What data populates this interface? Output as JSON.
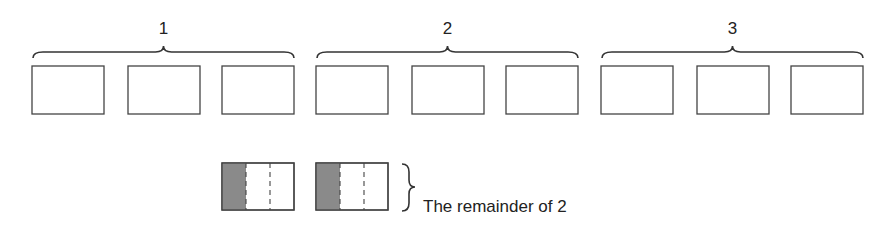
{
  "groups": [
    {
      "label": "1",
      "box_count": 3
    },
    {
      "label": "2",
      "box_count": 3
    },
    {
      "label": "3",
      "box_count": 3
    }
  ],
  "remainder": {
    "box_count": 2,
    "parts_per_box": 3,
    "shaded_parts_per_box": 1,
    "label": "The remainder of 2"
  },
  "colors": {
    "shade": "#8a8a8a",
    "stroke": "#444444"
  }
}
